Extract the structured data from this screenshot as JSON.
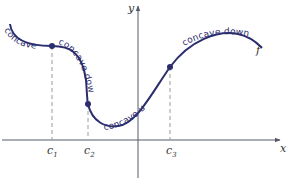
{
  "diagram": {
    "axes": {
      "x_label": "x",
      "y_label": "y"
    },
    "function_label": "f",
    "inflection_points": [
      {
        "label": "c",
        "subscript": "1"
      },
      {
        "label": "c",
        "subscript": "2"
      },
      {
        "label": "c",
        "subscript": "3"
      }
    ],
    "regions": [
      {
        "text": "concave up"
      },
      {
        "text": "concave down"
      },
      {
        "text": "concave up"
      },
      {
        "text": "concave down"
      }
    ],
    "colors": {
      "curve": "#2b2d6e",
      "axis": "#555a66",
      "dashed": "#9a9a9a"
    }
  }
}
